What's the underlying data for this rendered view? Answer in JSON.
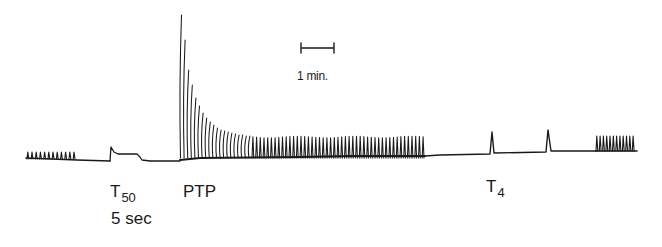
{
  "figure": {
    "ink_color": "#1a1a1a",
    "background": "#ffffff",
    "scale_bar": {
      "label": "1 min."
    },
    "annotations": {
      "t50": {
        "main": "T",
        "sub": "50",
        "duration": "5 sec"
      },
      "ptp": {
        "label": "PTP"
      },
      "t4": {
        "main": "T",
        "sub": "4"
      }
    }
  },
  "chart_data": {
    "type": "line",
    "title": "",
    "xlabel": "time",
    "ylabel": "twitch tension",
    "scale_bar": "1 min.",
    "segments": [
      {
        "name": "baseline twitches",
        "x_range": [
          26,
          77
        ],
        "relative_amplitude": 0.25
      },
      {
        "name": "T50 5 sec tetanus",
        "x_range": [
          110,
          150
        ],
        "relative_amplitude": 0.6
      },
      {
        "name": "PTP",
        "x_range": [
          180,
          425
        ],
        "peak_relative_amplitude": 3.8,
        "decay_to": 0.35
      },
      {
        "name": "T4 #1",
        "x": 492,
        "relative_amplitude": 0.6
      },
      {
        "name": "T4 #2",
        "x": 548,
        "relative_amplitude": 0.6
      },
      {
        "name": "recovery twitches",
        "x_range": [
          596,
          637
        ],
        "relative_amplitude": 0.45
      }
    ],
    "ptp_twitch_heights_px": [
      143,
      118,
      88,
      73,
      60,
      52,
      45,
      40,
      36,
      33,
      30,
      28,
      27,
      26,
      25,
      24,
      23,
      23,
      22,
      22
    ],
    "annotations": [
      "T50",
      "5 sec",
      "PTP",
      "T4"
    ]
  }
}
